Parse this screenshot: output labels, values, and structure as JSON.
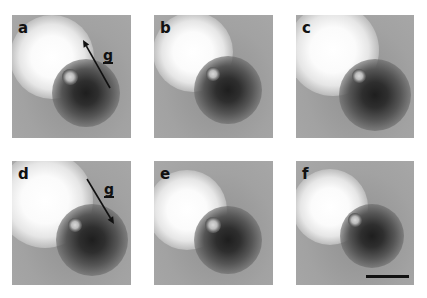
{
  "figure": {
    "panels": [
      {
        "id": "a",
        "label": "a",
        "box": {
          "x": 12,
          "y": 15,
          "w": 119,
          "h": 123
        },
        "bright": {
          "cx": 40,
          "cy": 42,
          "r": 42
        },
        "dark": {
          "cx": 74,
          "cy": 78,
          "r": 34
        },
        "defect": {
          "cx": 58,
          "cy": 62,
          "r": 8
        },
        "g_vector": {
          "label": "g",
          "from": [
            98,
            73
          ],
          "to": [
            71,
            25
          ],
          "label_pos": [
            91,
            33
          ]
        }
      },
      {
        "id": "b",
        "label": "b",
        "box": {
          "x": 154,
          "y": 15,
          "w": 119,
          "h": 123
        },
        "bright": {
          "cx": 39,
          "cy": 37,
          "r": 40
        },
        "dark": {
          "cx": 74,
          "cy": 75,
          "r": 34
        },
        "defect": {
          "cx": 59,
          "cy": 59,
          "r": 7
        }
      },
      {
        "id": "c",
        "label": "c",
        "box": {
          "x": 296,
          "y": 15,
          "w": 118,
          "h": 123
        },
        "bright": {
          "cx": 37,
          "cy": 35,
          "r": 46
        },
        "dark": {
          "cx": 79,
          "cy": 80,
          "r": 36
        },
        "defect": {
          "cx": 63,
          "cy": 61,
          "r": 7
        }
      },
      {
        "id": "d",
        "label": "d",
        "box": {
          "x": 12,
          "y": 161,
          "w": 119,
          "h": 124
        },
        "bright": {
          "cx": 33,
          "cy": 39,
          "r": 48
        },
        "dark": {
          "cx": 80,
          "cy": 79,
          "r": 36
        },
        "defect": {
          "cx": 63,
          "cy": 64,
          "r": 7
        },
        "g_vector": {
          "label": "g",
          "from": [
            75,
            18
          ],
          "to": [
            102,
            63
          ],
          "label_pos": [
            92,
            21
          ]
        }
      },
      {
        "id": "e",
        "label": "e",
        "box": {
          "x": 154,
          "y": 161,
          "w": 119,
          "h": 124
        },
        "bright": {
          "cx": 33,
          "cy": 49,
          "r": 40
        },
        "dark": {
          "cx": 74,
          "cy": 79,
          "r": 34
        },
        "defect": {
          "cx": 59,
          "cy": 64,
          "r": 8
        }
      },
      {
        "id": "f",
        "label": "f",
        "box": {
          "x": 296,
          "y": 161,
          "w": 118,
          "h": 124
        },
        "bright": {
          "cx": 34,
          "cy": 46,
          "r": 38
        },
        "dark": {
          "cx": 76,
          "cy": 75,
          "r": 32
        },
        "defect": {
          "cx": 59,
          "cy": 59,
          "r": 7
        },
        "scale_bar": {
          "x": 70,
          "y": 114,
          "w": 43,
          "h": 3
        }
      }
    ]
  }
}
